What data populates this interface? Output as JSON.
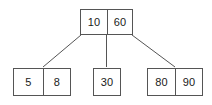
{
  "diagram": {
    "kind": "b-tree",
    "colors": {
      "background": "#ffffff",
      "border": "#555555",
      "text": "#1a1a1a",
      "edge": "#555555"
    },
    "root": {
      "name": "root-node",
      "keys": [
        "10",
        "60"
      ]
    },
    "leaves": [
      {
        "name": "leaf-node-left",
        "keys": [
          "5",
          "8"
        ]
      },
      {
        "name": "leaf-node-middle",
        "keys": [
          "30"
        ]
      },
      {
        "name": "leaf-node-right",
        "keys": [
          "80",
          "90"
        ]
      }
    ],
    "edges": [
      {
        "name": "edge-root-to-left-leaf",
        "x1": 81,
        "y1": 35,
        "x2": 43,
        "y2": 67
      },
      {
        "name": "edge-root-to-middle-leaf",
        "x1": 106.5,
        "y1": 35,
        "x2": 106.5,
        "y2": 67
      },
      {
        "name": "edge-root-to-right-leaf",
        "x1": 132,
        "y1": 35,
        "x2": 175,
        "y2": 67
      }
    ]
  }
}
